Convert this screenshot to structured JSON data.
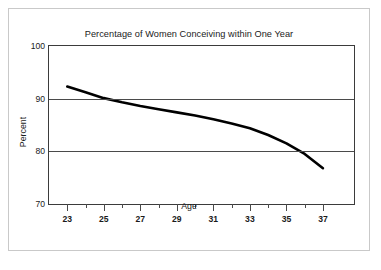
{
  "figure": {
    "background_color": "#ffffff",
    "border_color": "#c9c9c9",
    "axis_color": "#3b3b3b",
    "grid_color": "#4a4a4a",
    "series_color": "#000000"
  },
  "chart_data": {
    "type": "line",
    "title": "Percentage of Women Conceiving within One Year",
    "xlabel": "Age",
    "ylabel": "Percent",
    "xlim": [
      22.0,
      38.7
    ],
    "ylim": [
      70,
      100
    ],
    "grid": "horizontal",
    "legend": "none",
    "x_major_ticks": [
      23,
      25,
      27,
      29,
      31,
      33,
      35,
      37
    ],
    "x_minor_ticks": [
      24,
      26,
      28,
      30,
      32,
      34,
      36
    ],
    "x_tick_labels": [
      "23",
      "25",
      "27",
      "29",
      "31",
      "33",
      "35",
      "37"
    ],
    "y_ticks": [
      70,
      80,
      90,
      100
    ],
    "y_tick_labels": [
      "70",
      "80",
      "90",
      "100"
    ],
    "x": [
      23,
      24,
      25,
      26,
      27,
      28,
      29,
      30,
      31,
      32,
      33,
      34,
      35,
      36,
      37
    ],
    "series": [
      {
        "name": "Percentage conceiving within one year",
        "values": [
          92.3,
          91.2,
          90.1,
          89.3,
          88.6,
          88.0,
          87.4,
          86.8,
          86.1,
          85.3,
          84.4,
          83.1,
          81.5,
          79.5,
          76.8
        ]
      }
    ]
  }
}
